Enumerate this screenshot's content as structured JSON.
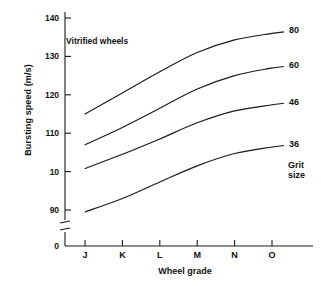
{
  "chart_data": {
    "type": "line",
    "title": "",
    "annotation": "Vitrified wheels",
    "legend_caption_line1": "Grit",
    "legend_caption_line2": "size",
    "legend_position": "right-of-curves",
    "grid": false,
    "xlabel": "Wheel grade",
    "ylabel": "Bursting speed (m/s)",
    "categories": [
      "J",
      "K",
      "L",
      "M",
      "N",
      "O"
    ],
    "x": [
      0,
      1,
      2,
      3,
      4,
      5
    ],
    "ytick_labels": [
      "140",
      "130",
      "120",
      "110",
      "10",
      "90",
      "0"
    ],
    "ytick_values": [
      140,
      130,
      120,
      110,
      100,
      90,
      0
    ],
    "ylim": [
      90,
      140
    ],
    "axis_break": true,
    "axis_break_between": [
      90,
      0
    ],
    "series": [
      {
        "name": "80",
        "label": "80",
        "values": [
          115.0,
          120.5,
          126.0,
          131.0,
          134.3,
          136.0
        ]
      },
      {
        "name": "60",
        "label": "60",
        "values": [
          107.0,
          111.5,
          116.5,
          121.5,
          125.0,
          127.0
        ]
      },
      {
        "name": "46",
        "label": "46",
        "values": [
          100.8,
          104.5,
          108.5,
          112.7,
          115.8,
          117.4
        ]
      },
      {
        "name": "36",
        "label": "36",
        "values": [
          89.5,
          93.0,
          97.3,
          101.5,
          104.7,
          106.4
        ]
      }
    ]
  }
}
